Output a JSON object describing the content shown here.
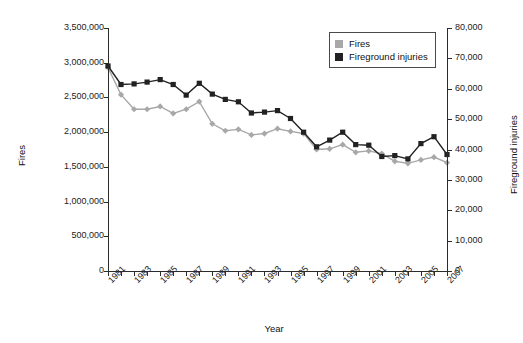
{
  "chart_data": {
    "type": "line",
    "title": "",
    "xlabel": "Year",
    "ylabel": "Fires",
    "y2label": "Fireground injuries",
    "grid": false,
    "legend_position": "top-right",
    "x": [
      1981,
      1982,
      1983,
      1984,
      1985,
      1986,
      1987,
      1988,
      1989,
      1990,
      1991,
      1992,
      1993,
      1994,
      1995,
      1996,
      1997,
      1998,
      1999,
      2000,
      2001,
      2002,
      2003,
      2004,
      2005,
      2006,
      2007
    ],
    "xtick_labels": [
      "1981",
      "1982",
      "1983",
      "1984",
      "1985",
      "1986",
      "1987",
      "1988",
      "1989",
      "1990",
      "1991",
      "1992",
      "1993",
      "1994",
      "1995",
      "1996",
      "1997",
      "1998",
      "1999",
      "2000",
      "2001",
      "2002",
      "2003",
      "2004",
      "2005",
      "2006",
      "2007"
    ],
    "xtick_labels_shown": [
      "1981",
      "1983",
      "1985",
      "1987",
      "1989",
      "1991",
      "1993",
      "1995",
      "1997",
      "1999",
      "2001",
      "2003",
      "2005",
      "2007"
    ],
    "ylim": [
      0,
      3500000
    ],
    "ytick_labels": [
      "3,500,000",
      "3,000,000",
      "2,500,000",
      "2,000,000",
      "1,500,000",
      "1,000,000",
      "500,000",
      "0"
    ],
    "ytick_values": [
      3500000,
      3000000,
      2500000,
      2000000,
      1500000,
      1000000,
      500000,
      0
    ],
    "y2lim": [
      0,
      80000
    ],
    "y2tick_labels": [
      "80,000",
      "70,000",
      "60,000",
      "50,000",
      "40,000",
      "30,000",
      "20,000",
      "10,000",
      "0"
    ],
    "y2tick_values": [
      80000,
      70000,
      60000,
      50000,
      40000,
      30000,
      20000,
      10000,
      0
    ],
    "series": [
      {
        "name": "Fires",
        "axis": "left",
        "color": "#a8a8a8",
        "marker": "diamond",
        "values": [
          2930000,
          2540000,
          2330000,
          2330000,
          2370000,
          2270000,
          2330000,
          2440000,
          2120000,
          2020000,
          2040000,
          1960000,
          1980000,
          2050000,
          2010000,
          1980000,
          1750000,
          1760000,
          1820000,
          1710000,
          1730000,
          1690000,
          1580000,
          1550000,
          1600000,
          1640000,
          1560000
        ]
      },
      {
        "name": "Fireground injuries",
        "axis": "right",
        "color": "#222222",
        "marker": "square",
        "values": [
          67500,
          61400,
          61600,
          62200,
          63000,
          61400,
          57900,
          61800,
          58250,
          56500,
          55700,
          52000,
          52300,
          52800,
          50200,
          45700,
          40900,
          43100,
          45700,
          41600,
          41400,
          37700,
          38000,
          36900,
          41950,
          44200,
          38350
        ]
      }
    ]
  },
  "legend": {
    "items": [
      {
        "label": "Fires",
        "color": "#a8a8a8"
      },
      {
        "label": "Fireground injuries",
        "color": "#222222"
      }
    ]
  }
}
